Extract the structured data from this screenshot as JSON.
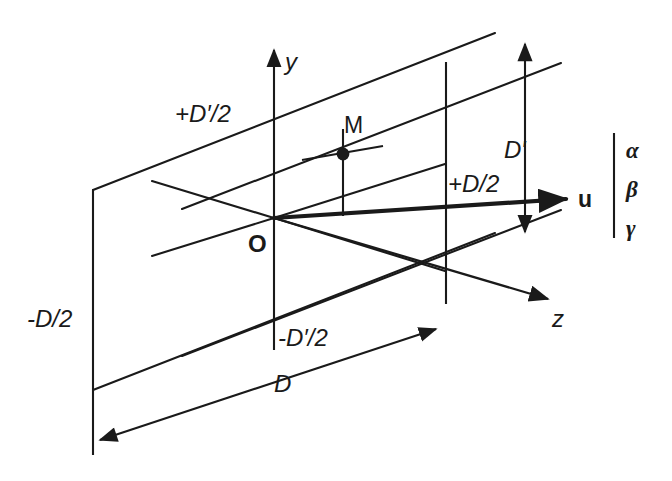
{
  "figure": {
    "stroke_color": "#1a1a1a",
    "background": "#ffffff"
  },
  "axes": {
    "y_label": "y",
    "z_label": "z",
    "origin_label": "O"
  },
  "points": {
    "m_label": "M"
  },
  "vector": {
    "name_label": "u",
    "components": [
      "α",
      "β",
      "γ"
    ]
  },
  "dimensions": {
    "d_label": "D",
    "d_prime_label": "D′",
    "plus_d_half": "+D/2",
    "minus_d_half": "-D/2",
    "plus_d_prime_half": "+D′/2",
    "minus_d_prime_half": "-D′/2"
  }
}
